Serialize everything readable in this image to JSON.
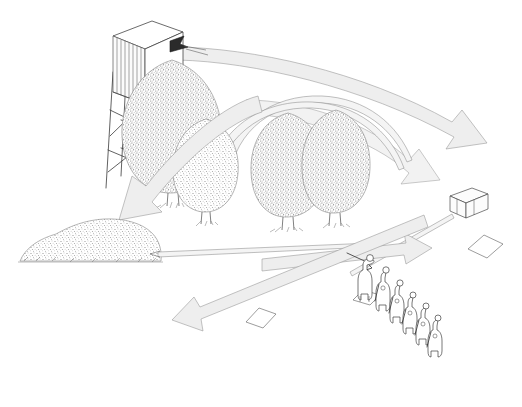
{
  "illustration": {
    "title": "Hunting high seat field-of-fire diagram",
    "style": "pen-and-ink line drawing with stippled vegetation",
    "background_color": "#ffffff",
    "line_color": "#3a3a3a",
    "arrow_fill": "#eeeeee",
    "arrow_stroke": "#9a9a9a",
    "dark_arrow_fill": "#2b2b2b",
    "width": 522,
    "height": 407
  },
  "objects": {
    "high_seat": {
      "name": "elevated hunting tower / high seat",
      "label": "",
      "position": {
        "x": 100,
        "y": 15,
        "w": 95,
        "h": 155
      },
      "parts": [
        "cabin box",
        "vertical slat siding",
        "viewing window",
        "four-legged lattice tower",
        "cross bracing"
      ]
    },
    "dark_arrowhead": {
      "name": "incoming shot arrowhead into high seat",
      "label": "",
      "position": {
        "x": 168,
        "y": 40
      }
    },
    "hedge": {
      "name": "low stippled hedge / brush mound",
      "label": "",
      "position": {
        "x": 18,
        "y": 215,
        "w": 145,
        "h": 50
      }
    },
    "crate": {
      "name": "small box / crate target marker",
      "label": "",
      "position": {
        "x": 446,
        "y": 188,
        "w": 40,
        "h": 30
      }
    },
    "ground_marker": {
      "name": "diamond ground marker plate",
      "label": "",
      "position": {
        "x": 465,
        "y": 235,
        "w": 38,
        "h": 24
      }
    },
    "ground_marker_2": {
      "name": "second diamond ground marker plate",
      "label": "",
      "position": {
        "x": 246,
        "y": 308,
        "w": 30,
        "h": 20
      }
    }
  },
  "trees": [
    {
      "name": "tree-left-large",
      "cx": 172,
      "cy": 125,
      "rx": 48,
      "ry": 62
    },
    {
      "name": "tree-left-small",
      "cx": 205,
      "cy": 163,
      "rx": 30,
      "ry": 42
    },
    {
      "name": "tree-center",
      "cx": 288,
      "cy": 168,
      "rx": 36,
      "ry": 52
    },
    {
      "name": "tree-right",
      "cx": 337,
      "cy": 163,
      "rx": 32,
      "ry": 50
    }
  ],
  "figures": {
    "count": 6,
    "description": "line of standing hunters, leading figure shouldering a rifle",
    "items": [
      {
        "name": "shooter-aiming",
        "x": 368,
        "y": 258,
        "height": 44,
        "aiming": true
      },
      {
        "name": "hunter-2",
        "x": 383,
        "y": 272,
        "height": 40,
        "aiming": false
      },
      {
        "name": "hunter-3",
        "x": 397,
        "y": 285,
        "height": 38,
        "aiming": false
      },
      {
        "name": "hunter-4",
        "x": 409,
        "y": 296,
        "height": 37,
        "aiming": false
      },
      {
        "name": "hunter-5",
        "x": 421,
        "y": 307,
        "height": 36,
        "aiming": false
      },
      {
        "name": "hunter-6",
        "x": 432,
        "y": 318,
        "height": 35,
        "aiming": false
      }
    ]
  },
  "arrows": [
    {
      "name": "arrow-sweep-upper-right",
      "kind": "curved-band",
      "direction": "high seat to far right",
      "head": "down-right"
    },
    {
      "name": "arrow-sweep-mid-right",
      "kind": "curved-band",
      "direction": "over trees to right",
      "head": "down-right"
    },
    {
      "name": "arrow-sweep-down-left",
      "kind": "curved-band",
      "direction": "over trees toward hedge",
      "head": "down-left"
    },
    {
      "name": "arrow-thin-arc-a",
      "kind": "thin-arc",
      "direction": "arc over trees",
      "head": "none"
    },
    {
      "name": "arrow-thin-arc-b",
      "kind": "thin-arc",
      "direction": "arc over trees",
      "head": "none"
    },
    {
      "name": "arrow-ground-to-hedge",
      "kind": "thin-straight",
      "direction": "from shooters to hedge",
      "head": "left"
    },
    {
      "name": "arrow-ground-to-crate",
      "kind": "thin-straight",
      "direction": "from shooters to crate",
      "head": "right"
    },
    {
      "name": "arrow-ground-long-right",
      "kind": "straight-band",
      "direction": "to the right past shooters",
      "head": "right"
    },
    {
      "name": "arrow-ground-long-left",
      "kind": "straight-band",
      "direction": "down-left across field",
      "head": "down-left"
    },
    {
      "name": "arrow-into-high-seat",
      "kind": "dark-head",
      "direction": "into high seat window",
      "head": "left"
    }
  ]
}
